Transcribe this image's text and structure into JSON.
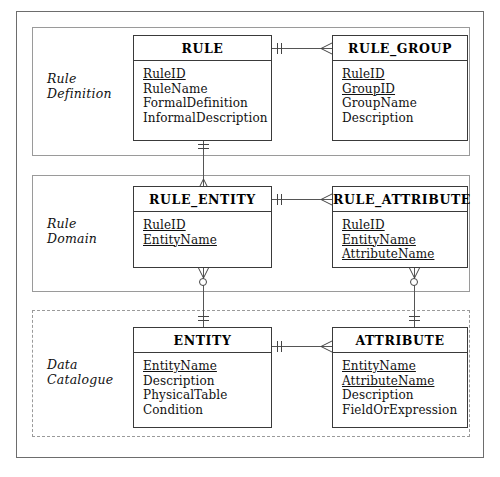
{
  "diagram": {
    "sections": [
      {
        "id": "rule-definition",
        "label": "Rule\nDefinition",
        "border": "solid"
      },
      {
        "id": "rule-domain",
        "label": "Rule\nDomain",
        "border": "solid"
      },
      {
        "id": "data-catalogue",
        "label": "Data\nCatalogue",
        "border": "dashed"
      }
    ],
    "entities": [
      {
        "id": "rule",
        "name": "RULE",
        "attributes": [
          {
            "name": "RuleID",
            "key": true
          },
          {
            "name": "RuleName",
            "key": false
          },
          {
            "name": "FormalDefinition",
            "key": false
          },
          {
            "name": "InformalDescription",
            "key": false
          }
        ]
      },
      {
        "id": "rule-group",
        "name": "RULE_GROUP",
        "attributes": [
          {
            "name": "RuleID",
            "key": true
          },
          {
            "name": "GroupID",
            "key": true
          },
          {
            "name": "GroupName",
            "key": false
          },
          {
            "name": "Description",
            "key": false
          }
        ]
      },
      {
        "id": "rule-entity",
        "name": "RULE_ENTITY",
        "attributes": [
          {
            "name": "RuleID",
            "key": true
          },
          {
            "name": "EntityName",
            "key": true
          }
        ]
      },
      {
        "id": "rule-attribute",
        "name": "RULE_ATTRIBUTE",
        "attributes": [
          {
            "name": "RuleID",
            "key": true
          },
          {
            "name": "EntityName",
            "key": true
          },
          {
            "name": "AttributeName",
            "key": true
          }
        ]
      },
      {
        "id": "entity",
        "name": "ENTITY",
        "attributes": [
          {
            "name": "EntityName",
            "key": true
          },
          {
            "name": "Description",
            "key": false
          },
          {
            "name": "PhysicalTable",
            "key": false
          },
          {
            "name": "Condition",
            "key": false
          }
        ]
      },
      {
        "id": "attribute",
        "name": "ATTRIBUTE",
        "attributes": [
          {
            "name": "EntityName",
            "key": true
          },
          {
            "name": "AttributeName",
            "key": true
          },
          {
            "name": "Description",
            "key": false
          },
          {
            "name": "FieldOrExpression",
            "key": false
          }
        ]
      }
    ],
    "relationships": [
      {
        "id": "rule-to-rule-group",
        "from": "RULE",
        "to": "RULE_GROUP",
        "from_cardinality": "one-and-only-one",
        "to_cardinality": "many"
      },
      {
        "id": "rule-to-rule-entity",
        "from": "RULE",
        "to": "RULE_ENTITY",
        "from_cardinality": "one-and-only-one",
        "to_cardinality": "many"
      },
      {
        "id": "rule-entity-to-rule-attribute",
        "from": "RULE_ENTITY",
        "to": "RULE_ATTRIBUTE",
        "from_cardinality": "one-and-only-one",
        "to_cardinality": "many"
      },
      {
        "id": "entity-to-rule-entity",
        "from": "ENTITY",
        "to": "RULE_ENTITY",
        "from_cardinality": "one-and-only-one",
        "to_cardinality": "zero-or-many"
      },
      {
        "id": "attribute-to-rule-attribute",
        "from": "ATTRIBUTE",
        "to": "RULE_ATTRIBUTE",
        "from_cardinality": "one-and-only-one",
        "to_cardinality": "zero-or-many"
      },
      {
        "id": "entity-to-attribute",
        "from": "ENTITY",
        "to": "ATTRIBUTE",
        "from_cardinality": "one-and-only-one",
        "to_cardinality": "many"
      }
    ],
    "colors": {
      "frame": "#6d6d6d",
      "section_border": "#9a9a9a",
      "entity_border": "#3a3a3a",
      "line": "#555555",
      "text": "#111111",
      "background": "#ffffff"
    }
  }
}
